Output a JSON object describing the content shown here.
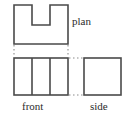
{
  "figure": {
    "kind": "orthographic-projection-diagram",
    "background_color": "#ffffff",
    "stroke_color": "#4a4a4a",
    "dashed_color": "#8c8c8c",
    "text_color": "#2b2b2b",
    "stroke_width": 1.6,
    "dash_pattern": "1.5 2.5"
  },
  "labels": {
    "plan": "plan",
    "front": "front",
    "side": "side"
  },
  "views": {
    "plan": {
      "name": "plan",
      "outline_points": "14,5 68,5 68,44 14,44",
      "notch_points": "32,5 32,25 50,25 50,5",
      "outline_path": "M 14 5 L 32 5 L 32 25 L 50 25 L 50 5 L 68 5 L 68 44 L 14 44 Z",
      "x": 14,
      "y": 5,
      "width": 54,
      "height": 39,
      "notch": {
        "x": 32,
        "y": 5,
        "width": 18,
        "height": 20
      }
    },
    "front": {
      "name": "front",
      "x": 14,
      "y": 58,
      "width": 54,
      "height": 37,
      "dividers_x": [
        32,
        50
      ]
    },
    "side": {
      "name": "side",
      "x": 84,
      "y": 58,
      "width": 37,
      "height": 37
    }
  },
  "projection_lines": {
    "vertical": [
      {
        "name": "plan-left-to-front-left",
        "x": 14,
        "y1": 45,
        "y2": 57
      },
      {
        "name": "plan-right-to-front-right",
        "x": 68,
        "y1": 45,
        "y2": 57
      }
    ],
    "horizontal": [
      {
        "name": "front-top-to-side-top",
        "y": 58,
        "x1": 69,
        "x2": 83
      },
      {
        "name": "front-bottom-to-side-bottom",
        "y": 95,
        "x1": 69,
        "x2": 83
      }
    ]
  }
}
